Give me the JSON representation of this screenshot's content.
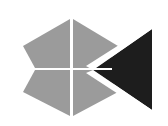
{
  "image": {
    "kind": "logo-mark",
    "title": "Abstract logo mark",
    "width": 168,
    "height": 126,
    "background_color": "#ffffff"
  },
  "palette": {
    "grey": "#9b9b9b",
    "dark": "#1d1d1d",
    "white": "#ffffff"
  },
  "shapes": {
    "upper_diamond": {
      "name": "upper-grey-diamond",
      "color": "#9b9b9b",
      "points": "23,46 70,19 118,46 70,68",
      "texture": "halftone-dither"
    },
    "lower_diamond": {
      "name": "lower-grey-diamond",
      "color": "#9b9b9b",
      "points": "70,70 118,48 70,116 23,92",
      "texture": "halftone-dither"
    },
    "dark_triangle": {
      "name": "dark-left-pointing-triangle",
      "color": "#1d1d1d",
      "points": "93,70 152,29 152,110",
      "texture": "solid"
    },
    "vertical_gap": {
      "name": "white-vertical-gap",
      "color": "#ffffff",
      "x": 70,
      "top": 19,
      "bottom": 117,
      "width": 3
    }
  }
}
